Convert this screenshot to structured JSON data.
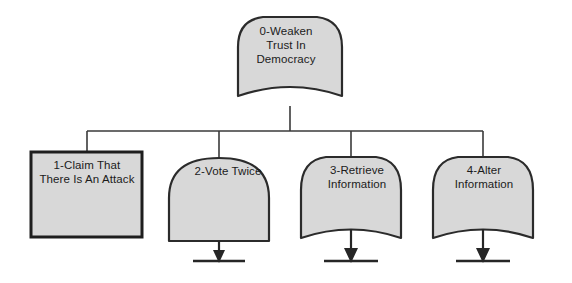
{
  "diagram": {
    "type": "attack-tree",
    "title": "0-Weaken Trust In Democracy",
    "colors": {
      "node_fill": "#d8d8d8",
      "node_stroke": "#2b2b2b",
      "connector": "#3a3a3a",
      "text": "#1b1b1b",
      "background": "#ffffff"
    },
    "root": {
      "id": "0",
      "label": "0-Weaken\nTrust In\nDemocracy",
      "shape": "arched-top-concave-bottom",
      "has_arrow": false
    },
    "children": [
      {
        "id": "1",
        "label": "1-Claim That\nThere Is An Attack",
        "shape": "rectangle",
        "has_arrow": false
      },
      {
        "id": "2",
        "label": "2-Vote Twice",
        "shape": "arched-top-flat-bottom",
        "has_arrow": true
      },
      {
        "id": "3",
        "label": "3-Retrieve\nInformation",
        "shape": "arched-top-concave-bottom",
        "has_arrow": true
      },
      {
        "id": "4",
        "label": "4-Alter\nInformation",
        "shape": "arched-top-concave-bottom",
        "has_arrow": true
      }
    ]
  }
}
